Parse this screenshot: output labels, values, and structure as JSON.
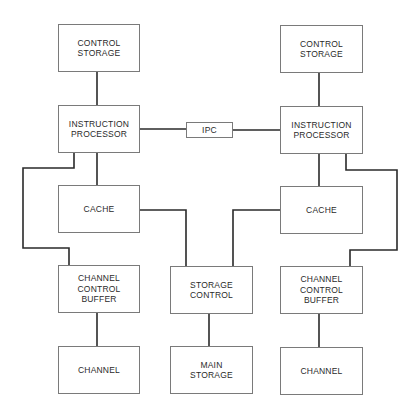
{
  "diagram": {
    "type": "block-diagram",
    "nodes": [
      {
        "id": "cs_left",
        "label": "CONTROL\nSTORAGE",
        "x": 58,
        "y": 24,
        "w": 82,
        "h": 48
      },
      {
        "id": "ip_left",
        "label": "INSTRUCTION\nPROCESSOR",
        "x": 58,
        "y": 105,
        "w": 82,
        "h": 48
      },
      {
        "id": "cache_left",
        "label": "CACHE",
        "x": 58,
        "y": 185,
        "w": 82,
        "h": 48
      },
      {
        "id": "ccb_left",
        "label": "CHANNEL\nCONTROL\nBUFFER",
        "x": 58,
        "y": 265,
        "w": 82,
        "h": 48
      },
      {
        "id": "channel_left",
        "label": "CHANNEL",
        "x": 58,
        "y": 346,
        "w": 82,
        "h": 48
      },
      {
        "id": "ipc",
        "label": "IPC",
        "x": 186,
        "y": 122,
        "w": 47,
        "h": 16
      },
      {
        "id": "storage_control",
        "label": "STORAGE\nCONTROL",
        "x": 170,
        "y": 266,
        "w": 83,
        "h": 48
      },
      {
        "id": "main_storage",
        "label": "MAIN\nSTORAGE",
        "x": 170,
        "y": 346,
        "w": 83,
        "h": 48
      },
      {
        "id": "cs_right",
        "label": "CONTROL\nSTORAGE",
        "x": 280,
        "y": 25,
        "w": 83,
        "h": 48
      },
      {
        "id": "ip_right",
        "label": "INSTRUCTION\nPROCESSOR",
        "x": 280,
        "y": 106,
        "w": 83,
        "h": 48
      },
      {
        "id": "cache_right",
        "label": "CACHE",
        "x": 280,
        "y": 186,
        "w": 83,
        "h": 48
      },
      {
        "id": "ccb_right",
        "label": "CHANNEL\nCONTROL\nBUFFER",
        "x": 280,
        "y": 266,
        "w": 83,
        "h": 48
      },
      {
        "id": "channel_right",
        "label": "CHANNEL",
        "x": 280,
        "y": 347,
        "w": 83,
        "h": 48
      }
    ],
    "edges": [
      {
        "from": "cs_left",
        "to": "ip_left",
        "path": "M97 72 V105"
      },
      {
        "from": "ip_left",
        "to": "ipc",
        "path": "M140 129 H186"
      },
      {
        "from": "ipc",
        "to": "ip_right",
        "path": "M233 130 H280"
      },
      {
        "from": "cs_right",
        "to": "ip_right",
        "path": "M319 73 V106"
      },
      {
        "from": "ip_left",
        "to": "cache_left",
        "path": "M97 153 V185"
      },
      {
        "from": "ip_right",
        "to": "cache_right",
        "path": "M319 154 V186"
      },
      {
        "from": "ip_left",
        "to": "ccb_left",
        "path": "M74 153 V168 H23 V248 H69 V265"
      },
      {
        "from": "ip_right",
        "to": "ccb_right",
        "path": "M346 154 V170 H397 V250 H350 V266"
      },
      {
        "from": "cache_left",
        "to": "storage_control",
        "path": "M140 210 H186 V266"
      },
      {
        "from": "cache_right",
        "to": "storage_control",
        "path": "M280 210 H233 V266"
      },
      {
        "from": "storage_control",
        "to": "main_storage",
        "path": "M209 314 V346"
      },
      {
        "from": "ccb_left",
        "to": "channel_left",
        "path": "M97 313 V346"
      },
      {
        "from": "ccb_right",
        "to": "channel_right",
        "path": "M319 314 V347"
      }
    ]
  }
}
